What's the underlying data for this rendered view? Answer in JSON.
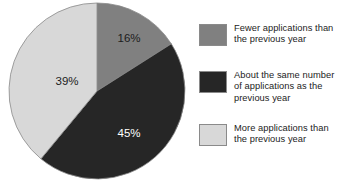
{
  "chart_data": {
    "type": "pie",
    "title": "",
    "subtitle": "",
    "xlabel": "",
    "ylabel": "",
    "grid": false,
    "legend_position": "right",
    "start_angle_deg": 0,
    "direction": "clockwise",
    "categories": [
      "Fewer applications than the previous year",
      "About the same number of applications as the previous year",
      "More applications than the previous year"
    ],
    "values": [
      16,
      45,
      39
    ],
    "value_unit": "%",
    "data_labels": [
      "16%",
      "45%",
      "39%"
    ],
    "colors": [
      "#808080",
      "#262626",
      "#d8d8d8"
    ],
    "label_text_colors": [
      "#1c1c1c",
      "#ffffff",
      "#1c1c1c"
    ],
    "slices": [
      {
        "name": "Fewer applications than the previous year",
        "value": 16,
        "label": "16%",
        "color": "#808080",
        "label_color": "#1c1c1c",
        "label_x": 124,
        "label_y": 42
      },
      {
        "name": "About the same number of applications as the previous year",
        "value": 45,
        "label": "45%",
        "color": "#262626",
        "label_color": "#ffffff",
        "label_x": 124,
        "label_y": 137
      },
      {
        "name": "More applications than the previous year",
        "value": 39,
        "label": "39%",
        "color": "#d8d8d8",
        "label_color": "#1c1c1c",
        "label_x": 62,
        "label_y": 85
      }
    ]
  },
  "legend": {
    "items": [
      {
        "label": "Fewer applications than\nthe previous year",
        "color": "#808080"
      },
      {
        "label": "About the same number\nof applications as the\nprevious year",
        "color": "#262626"
      },
      {
        "label": "More applications than\nthe previous year",
        "color": "#d8d8d8"
      }
    ]
  },
  "geometry": {
    "center_x": 92,
    "center_y": 91,
    "radius": 88
  }
}
